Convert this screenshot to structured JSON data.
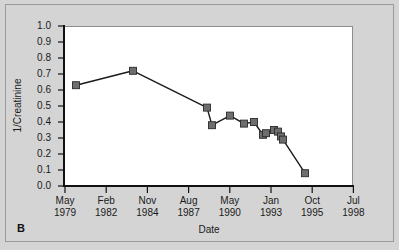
{
  "panel": {
    "label": "B"
  },
  "chart_data": {
    "type": "line",
    "title": "",
    "subtitle": "",
    "xlabel": "Date",
    "ylabel": "1/Creatinine",
    "grid": false,
    "legend": "none",
    "marker": "filled-square",
    "marker_color": "#6e6e6e",
    "line_color": "#1a1a1a",
    "plot_background": "#ffffff",
    "figure_background": "#d4d4d4",
    "ylim": [
      0.0,
      1.0
    ],
    "yticks": [
      "1.0",
      "0.9",
      "0.8",
      "0.7",
      "0.6",
      "0.5",
      "0.4",
      "0.3",
      "0.2",
      "0.1",
      "0.0"
    ],
    "ytick_values": [
      1.0,
      0.9,
      0.8,
      0.7,
      0.6,
      0.5,
      0.4,
      0.3,
      0.2,
      0.1,
      0.0
    ],
    "xticks": [
      {
        "month": "May",
        "year": "1979"
      },
      {
        "month": "Feb",
        "year": "1982"
      },
      {
        "month": "Nov",
        "year": "1984"
      },
      {
        "month": "Aug",
        "year": "1987"
      },
      {
        "month": "May",
        "year": "1990"
      },
      {
        "month": "Jan",
        "year": "1993"
      },
      {
        "month": "Oct",
        "year": "1995"
      },
      {
        "month": "Jul",
        "year": "1998"
      }
    ],
    "xtick_index": [
      0,
      1,
      2,
      3,
      4,
      5,
      6,
      7
    ],
    "series": [
      {
        "name": "1/Creatinine",
        "x_dates": [
          "Jul 1980",
          "Nov 1983",
          "Apr 1988",
          "Jan 1989",
          "Jun 1990",
          "Feb 1991",
          "Aug 1991",
          "Apr 1992",
          "Oct 1992",
          "Mar 1993",
          "Jun 1993",
          "Sep 1993",
          "Nov 1993",
          "Jun 1995"
        ],
        "x_positions": [
          76,
          133,
          207,
          212,
          230,
          244,
          254,
          263,
          266,
          274,
          278,
          281,
          283,
          305
        ],
        "values": [
          0.63,
          0.72,
          0.49,
          0.38,
          0.44,
          0.39,
          0.4,
          0.32,
          0.33,
          0.35,
          0.34,
          0.31,
          0.29,
          0.08
        ]
      }
    ]
  }
}
